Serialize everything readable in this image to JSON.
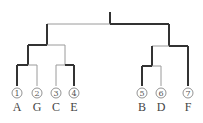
{
  "bracket": {
    "teams": [
      {
        "seed": "1",
        "name": "A"
      },
      {
        "seed": "2",
        "name": "G"
      },
      {
        "seed": "3",
        "name": "C"
      },
      {
        "seed": "4",
        "name": "E"
      },
      {
        "seed": "5",
        "name": "B"
      },
      {
        "seed": "6",
        "name": "D"
      },
      {
        "seed": "7",
        "name": "F"
      }
    ],
    "results": {
      "match_1": {
        "players": [
          "A",
          "G"
        ],
        "winner": "A"
      },
      "match_2": {
        "players": [
          "C",
          "E"
        ],
        "winner": "E"
      },
      "match_3": {
        "players": [
          "B",
          "D"
        ],
        "winner": "B"
      },
      "semi_1": {
        "players": [
          "A",
          "E"
        ],
        "winner": "A"
      },
      "semi_2": {
        "players": [
          "B",
          "F"
        ],
        "winner": "F"
      },
      "final": {
        "players": [
          "A",
          "F"
        ],
        "winner": "F"
      }
    }
  }
}
